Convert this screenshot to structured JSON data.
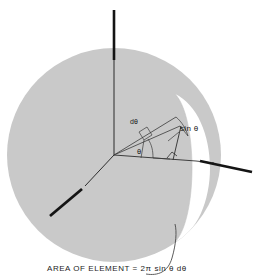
{
  "figure": {
    "background_color": "#ffffff",
    "sphere": {
      "name": "sphere",
      "fill_color": "#c9c9c9",
      "center_x": 114,
      "center_y": 155,
      "radius": 107
    },
    "band": {
      "name": "element-band",
      "fill_color": "#ffffff",
      "description": "white annular strip on sphere surface"
    },
    "axes": [
      {
        "name": "vertical-axis",
        "label": "",
        "orientation": "vertical"
      },
      {
        "name": "horizontal-axis-right",
        "label": "",
        "orientation": "right"
      },
      {
        "name": "oblique-axis-lower-left",
        "label": "",
        "orientation": "lower-left"
      }
    ],
    "labels": {
      "sin_theta": "sin θ",
      "d_theta": "dθ",
      "theta": "θ"
    },
    "caption": "AREA OF ELEMENT = 2π sin θ dθ",
    "line_color": "#1a1a1a",
    "thin_line_color": "#4a4a4a"
  }
}
